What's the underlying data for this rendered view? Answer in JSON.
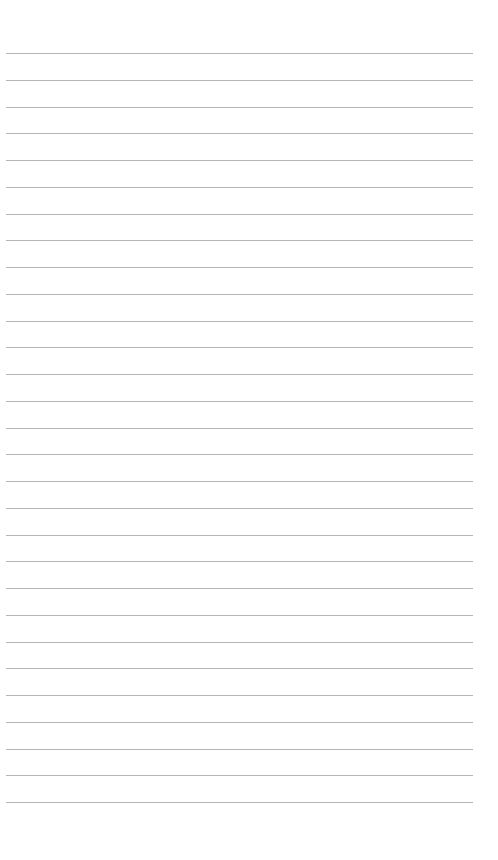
{
  "page": {
    "type": "blank lined paper",
    "line_count": 29,
    "first_line_y": 53,
    "line_spacing": 26.75,
    "line_left": 6,
    "line_width": 467,
    "line_color": "#a8a8a8",
    "background": "#ffffff"
  }
}
